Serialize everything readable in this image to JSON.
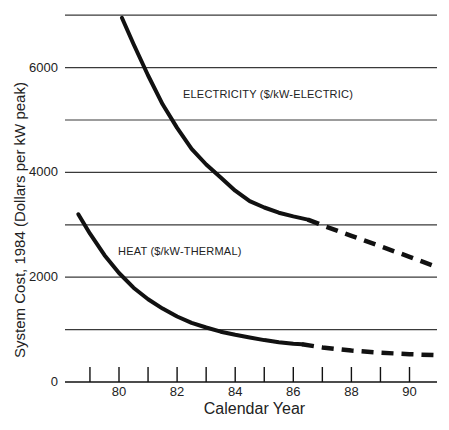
{
  "chart_data": {
    "type": "line",
    "title": "",
    "xlabel": "Calendar Year",
    "ylabel": "System Cost, 1984 (Dollars per kW peak)",
    "xlim": [
      78.1,
      91
    ],
    "ylim": [
      0,
      7000
    ],
    "x_ticks": [
      79,
      80,
      81,
      82,
      83,
      84,
      85,
      86,
      87,
      88,
      89,
      90
    ],
    "x_tick_labels": [
      "80",
      "82",
      "84",
      "86",
      "88",
      "90"
    ],
    "x_tick_label_values": [
      80,
      82,
      84,
      86,
      88,
      90
    ],
    "y_ticks": [
      0,
      1000,
      2000,
      3000,
      4000,
      5000,
      6000,
      7000
    ],
    "y_tick_labels": [
      "0",
      "2000",
      "4000",
      "6000"
    ],
    "y_tick_label_values": [
      0,
      2000,
      4000,
      6000
    ],
    "grid": {
      "horizontal": true,
      "vertical": false
    },
    "legend": "inline labels",
    "series": [
      {
        "name": "ELECTRICITY ($/kW-ELECTRIC)",
        "solid": {
          "x": [
            80.1,
            80.5,
            81,
            81.5,
            82,
            82.5,
            83,
            83.5,
            84,
            84.5,
            85,
            85.5,
            86,
            86.5
          ],
          "y": [
            6950,
            6450,
            5850,
            5300,
            4850,
            4450,
            4150,
            3900,
            3650,
            3450,
            3330,
            3230,
            3160,
            3100
          ]
        },
        "projected_dashed": {
          "x": [
            86.5,
            87,
            88,
            89,
            90,
            91
          ],
          "y": [
            3100,
            2990,
            2790,
            2590,
            2390,
            2180
          ]
        }
      },
      {
        "name": "HEAT ($/kW-THERMAL)",
        "solid": {
          "x": [
            78.6,
            79,
            79.5,
            80,
            80.5,
            81,
            81.5,
            82,
            82.5,
            83,
            83.5,
            84,
            84.5,
            85,
            85.5,
            86,
            86.3
          ],
          "y": [
            3200,
            2830,
            2420,
            2080,
            1800,
            1580,
            1400,
            1250,
            1130,
            1040,
            960,
            900,
            850,
            800,
            760,
            730,
            720
          ]
        },
        "projected_dashed": {
          "x": [
            86.3,
            87,
            88,
            89,
            90,
            91
          ],
          "y": [
            720,
            660,
            600,
            560,
            530,
            510
          ]
        }
      }
    ],
    "annotations": [
      {
        "text": "ELECTRICITY ($/kW-ELECTRIC)",
        "x": 82.2,
        "y": 5500
      },
      {
        "text": "HEAT ($/kW-THERMAL)",
        "x": 79.5,
        "y": 2600
      }
    ]
  },
  "labels": {
    "xlabel": "Calendar Year",
    "ylabel": "System Cost, 1984 (Dollars per kW peak)",
    "electricity": "ELECTRICITY ($/kW-ELECTRIC)",
    "heat": "HEAT ($/kW-THERMAL)",
    "x_ticks": [
      "80",
      "82",
      "84",
      "86",
      "88",
      "90"
    ],
    "y_ticks": [
      "0",
      "2000",
      "4000",
      "6000"
    ]
  },
  "colors": {
    "line": "#111111",
    "grid": "#3a3a3a",
    "text": "#222222",
    "background": "#ffffff"
  }
}
